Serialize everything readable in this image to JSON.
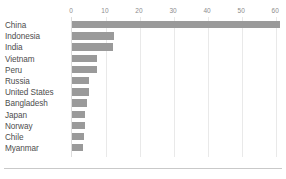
{
  "chart_data": {
    "type": "bar",
    "orientation": "horizontal",
    "title": "",
    "subtitle": "",
    "xlabel": "",
    "ylabel": "",
    "xlim": [
      0,
      62
    ],
    "grid": true,
    "legend": null,
    "legend_position": "none",
    "axis_position": "top",
    "bar_color": "#9a9a9a",
    "gridline_color": "#e9e9e9",
    "tick_label_color": "#8c8c8c",
    "category_label_color": "#4d4d4d",
    "ticks": [
      0,
      10,
      20,
      30,
      40,
      50,
      60
    ],
    "tick_labels": [
      "0",
      "10",
      "20",
      "30",
      "40",
      "50",
      "60"
    ],
    "categories": [
      "China",
      "Indonesia",
      "India",
      "Vietnam",
      "Peru",
      "Russia",
      "United States",
      "Bangladesh",
      "Japan",
      "Norway",
      "Chile",
      "Myanmar"
    ],
    "values": [
      61,
      12.2,
      12,
      7.4,
      7.3,
      5.1,
      5,
      4.3,
      3.8,
      3.7,
      3.5,
      3.1
    ]
  }
}
